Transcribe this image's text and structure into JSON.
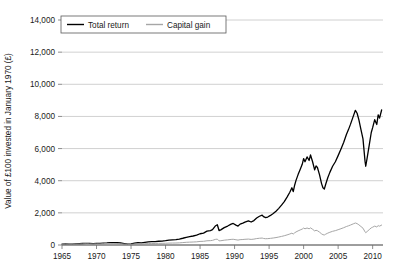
{
  "chart_data": {
    "type": "line",
    "title": "",
    "xlabel": "",
    "ylabel": "Value of £100 invested in January 1970 (£)",
    "xlim": [
      1965,
      2011.5
    ],
    "ylim": [
      0,
      14000
    ],
    "grid": true,
    "grid_axis": "y",
    "legend_position": "top-left",
    "xticks": [
      1965,
      1970,
      1975,
      1980,
      1985,
      1990,
      1995,
      2000,
      2005,
      2010
    ],
    "xtick_labels": [
      "1965",
      "1970",
      "1975",
      "1980",
      "1985",
      "1990",
      "1995",
      "2000",
      "2005",
      "2010"
    ],
    "yticks": [
      0,
      2000,
      4000,
      6000,
      8000,
      10000,
      12000,
      14000
    ],
    "ytick_labels": [
      "0",
      "2,000",
      "4,000",
      "6,000",
      "8,000",
      "10,000",
      "12,000",
      "14,000"
    ],
    "series": [
      {
        "name": "Total return",
        "color": "#000000",
        "width": 1.3,
        "x": [
          1965.0,
          1965.5,
          1966.0,
          1966.5,
          1967.0,
          1967.5,
          1968.0,
          1968.5,
          1969.0,
          1969.5,
          1970.0,
          1970.5,
          1971.0,
          1971.5,
          1972.0,
          1972.5,
          1973.0,
          1973.5,
          1974.0,
          1974.5,
          1975.0,
          1975.5,
          1976.0,
          1976.5,
          1977.0,
          1977.5,
          1978.0,
          1978.5,
          1979.0,
          1979.5,
          1980.0,
          1980.5,
          1981.0,
          1981.5,
          1982.0,
          1982.5,
          1983.0,
          1983.5,
          1984.0,
          1984.5,
          1985.0,
          1985.5,
          1986.0,
          1986.5,
          1986.8,
          1987.2,
          1987.5,
          1987.75,
          1988.0,
          1988.5,
          1989.0,
          1989.5,
          1989.8,
          1990.2,
          1990.5,
          1990.8,
          1991.2,
          1991.5,
          1992.0,
          1992.4,
          1992.8,
          1993.2,
          1993.6,
          1994.0,
          1994.2,
          1994.5,
          1994.8,
          1995.2,
          1995.6,
          1996.0,
          1996.4,
          1996.8,
          1997.2,
          1997.6,
          1998.0,
          1998.3,
          1998.5,
          1998.7,
          1998.9,
          1999.2,
          1999.5,
          1999.8,
          2000.0,
          2000.2,
          2000.5,
          2000.8,
          2001.0,
          2001.3,
          2001.6,
          2001.8,
          2002.0,
          2002.3,
          2002.6,
          2002.8,
          2003.0,
          2003.2,
          2003.5,
          2003.8,
          2004.2,
          2004.6,
          2005.0,
          2005.4,
          2005.8,
          2006.2,
          2006.5,
          2006.8,
          2007.2,
          2007.5,
          2007.75,
          2008.0,
          2008.3,
          2008.6,
          2008.9,
          2009.0,
          2009.2,
          2009.5,
          2009.8,
          2010.0,
          2010.3,
          2010.6,
          2010.8,
          2011.0,
          2011.3
        ],
        "y": [
          60,
          64,
          58,
          55,
          66,
          78,
          92,
          104,
          96,
          88,
          100,
          96,
          118,
          132,
          152,
          148,
          140,
          125,
          92,
          60,
          72,
          110,
          140,
          132,
          168,
          196,
          206,
          214,
          232,
          244,
          268,
          300,
          318,
          330,
          368,
          420,
          480,
          520,
          560,
          610,
          700,
          740,
          860,
          900,
          960,
          1180,
          1260,
          900,
          940,
          1080,
          1180,
          1300,
          1340,
          1240,
          1180,
          1300,
          1360,
          1420,
          1500,
          1430,
          1520,
          1680,
          1790,
          1860,
          1760,
          1700,
          1740,
          1840,
          1960,
          2100,
          2280,
          2480,
          2700,
          2980,
          3280,
          3560,
          3320,
          3720,
          4020,
          4380,
          4700,
          5020,
          5380,
          5180,
          5480,
          5260,
          5600,
          5180,
          4680,
          4920,
          4820,
          4380,
          3820,
          3560,
          3480,
          3780,
          4180,
          4520,
          4900,
          5180,
          5560,
          5960,
          6380,
          6880,
          7180,
          7520,
          8020,
          8380,
          8200,
          7800,
          7200,
          6600,
          5200,
          4900,
          5400,
          6200,
          7000,
          7300,
          7800,
          7500,
          8100,
          7900,
          8400
        ]
      },
      {
        "name": "Capital gain",
        "color": "#a6a6a6",
        "width": 1.0,
        "x": [
          1965.0,
          1965.5,
          1966.0,
          1966.5,
          1967.0,
          1967.5,
          1968.0,
          1968.5,
          1969.0,
          1969.5,
          1970.0,
          1970.5,
          1971.0,
          1971.5,
          1972.0,
          1972.5,
          1973.0,
          1973.5,
          1974.0,
          1974.5,
          1975.0,
          1975.5,
          1976.0,
          1976.5,
          1977.0,
          1977.5,
          1978.0,
          1978.5,
          1979.0,
          1979.5,
          1980.0,
          1980.5,
          1981.0,
          1981.5,
          1982.0,
          1982.5,
          1983.0,
          1983.5,
          1984.0,
          1984.5,
          1985.0,
          1985.5,
          1986.0,
          1986.5,
          1986.8,
          1987.2,
          1987.5,
          1987.75,
          1988.0,
          1988.5,
          1989.0,
          1989.5,
          1989.8,
          1990.2,
          1990.5,
          1990.8,
          1991.2,
          1991.5,
          1992.0,
          1992.4,
          1992.8,
          1993.2,
          1993.6,
          1994.0,
          1994.2,
          1994.5,
          1994.8,
          1995.2,
          1995.6,
          1996.0,
          1996.4,
          1996.8,
          1997.2,
          1997.6,
          1998.0,
          1998.3,
          1998.5,
          1998.7,
          1998.9,
          1999.2,
          1999.5,
          1999.8,
          2000.0,
          2000.2,
          2000.5,
          2000.8,
          2001.0,
          2001.3,
          2001.6,
          2001.8,
          2002.0,
          2002.3,
          2002.6,
          2002.8,
          2003.0,
          2003.2,
          2003.5,
          2003.8,
          2004.2,
          2004.6,
          2005.0,
          2005.4,
          2005.8,
          2006.2,
          2006.5,
          2006.8,
          2007.2,
          2007.5,
          2007.75,
          2008.0,
          2008.3,
          2008.6,
          2008.9,
          2009.0,
          2009.2,
          2009.5,
          2009.8,
          2010.0,
          2010.3,
          2010.6,
          2010.8,
          2011.0,
          2011.3
        ],
        "y": [
          52,
          54,
          48,
          45,
          52,
          60,
          68,
          74,
          68,
          62,
          70,
          66,
          78,
          86,
          96,
          92,
          86,
          74,
          54,
          34,
          40,
          58,
          72,
          66,
          80,
          90,
          92,
          94,
          100,
          102,
          108,
          118,
          122,
          124,
          134,
          150,
          168,
          178,
          186,
          198,
          222,
          230,
          262,
          272,
          288,
          348,
          366,
          258,
          266,
          300,
          322,
          348,
          356,
          326,
          306,
          332,
          342,
          354,
          368,
          348,
          366,
          400,
          420,
          432,
          406,
          390,
          396,
          414,
          436,
          462,
          496,
          534,
          576,
          628,
          684,
          736,
          682,
          758,
          812,
          878,
          936,
          990,
          1054,
          1008,
          1058,
          1008,
          1066,
          978,
          876,
          914,
          890,
          802,
          694,
          642,
          624,
          672,
          738,
          792,
          852,
          894,
          952,
          1012,
          1076,
          1150,
          1194,
          1244,
          1318,
          1368,
          1330,
          1258,
          1152,
          1048,
          818,
          766,
          838,
          954,
          1068,
          1108,
          1176,
          1124,
          1206,
          1172,
          1240
        ]
      }
    ]
  },
  "legend": {
    "items": [
      {
        "label": "Total return",
        "color": "#000000"
      },
      {
        "label": "Capital gain",
        "color": "#a6a6a6"
      }
    ]
  }
}
